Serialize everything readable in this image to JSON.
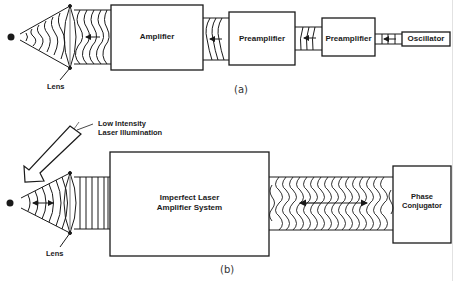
{
  "figure_a": {
    "caption": "(a)",
    "lens_label": "Lens",
    "blocks": [
      {
        "id": "amplifier",
        "label": "Amplifier"
      },
      {
        "id": "preamplifier_1",
        "label": "Preamplifier"
      },
      {
        "id": "preamplifier_2",
        "label": "Preamplifier"
      },
      {
        "id": "oscillator",
        "label": "Oscillator"
      }
    ],
    "beam_direction": "right-to-left"
  },
  "figure_b": {
    "caption": "(b)",
    "lens_label": "Lens",
    "illumination_label_line1": "Low Intensity",
    "illumination_label_line2": "Laser Illumination",
    "blocks": [
      {
        "id": "imperfect_amplifier",
        "label_line1": "Imperfect Laser",
        "label_line2": "Amplifier System"
      },
      {
        "id": "phase_conjugator",
        "label_line1": "Phase",
        "label_line2": "Conjugator"
      }
    ],
    "beam_direction": "bidirectional"
  },
  "colors": {
    "stroke": "#1a1a1a",
    "background": "#ffffff"
  }
}
